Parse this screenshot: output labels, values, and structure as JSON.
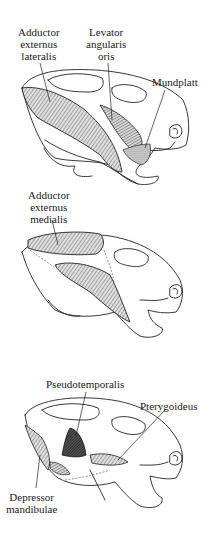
{
  "figure": {
    "panels": [
      {
        "id": "top",
        "labels": [
          {
            "name": "adductor-externus-lateralis",
            "lines": [
              "Adductor",
              "externus",
              "lateralis"
            ]
          },
          {
            "name": "levator-angularis-oris",
            "lines": [
              "Levator",
              "angularis",
              "oris"
            ]
          },
          {
            "name": "mundplatt",
            "lines": [
              "Mundplatt"
            ]
          }
        ]
      },
      {
        "id": "middle",
        "labels": [
          {
            "name": "adductor-externus-medialis",
            "lines": [
              "Adductor",
              "externus",
              "medialis"
            ]
          }
        ]
      },
      {
        "id": "bottom",
        "labels": [
          {
            "name": "pseudotemporalis",
            "lines": [
              "Pseudotemporalis"
            ]
          },
          {
            "name": "pterygoideus",
            "lines": [
              "Pterygoideus"
            ]
          },
          {
            "name": "depressor-mandibulae",
            "lines": [
              "Depressor",
              "mandibulae"
            ]
          }
        ]
      }
    ]
  },
  "colors": {
    "ink": "#222222",
    "muscle_fill": "#9a9a9a",
    "dark_muscle": "#3a3a3a",
    "background": "#ffffff"
  }
}
